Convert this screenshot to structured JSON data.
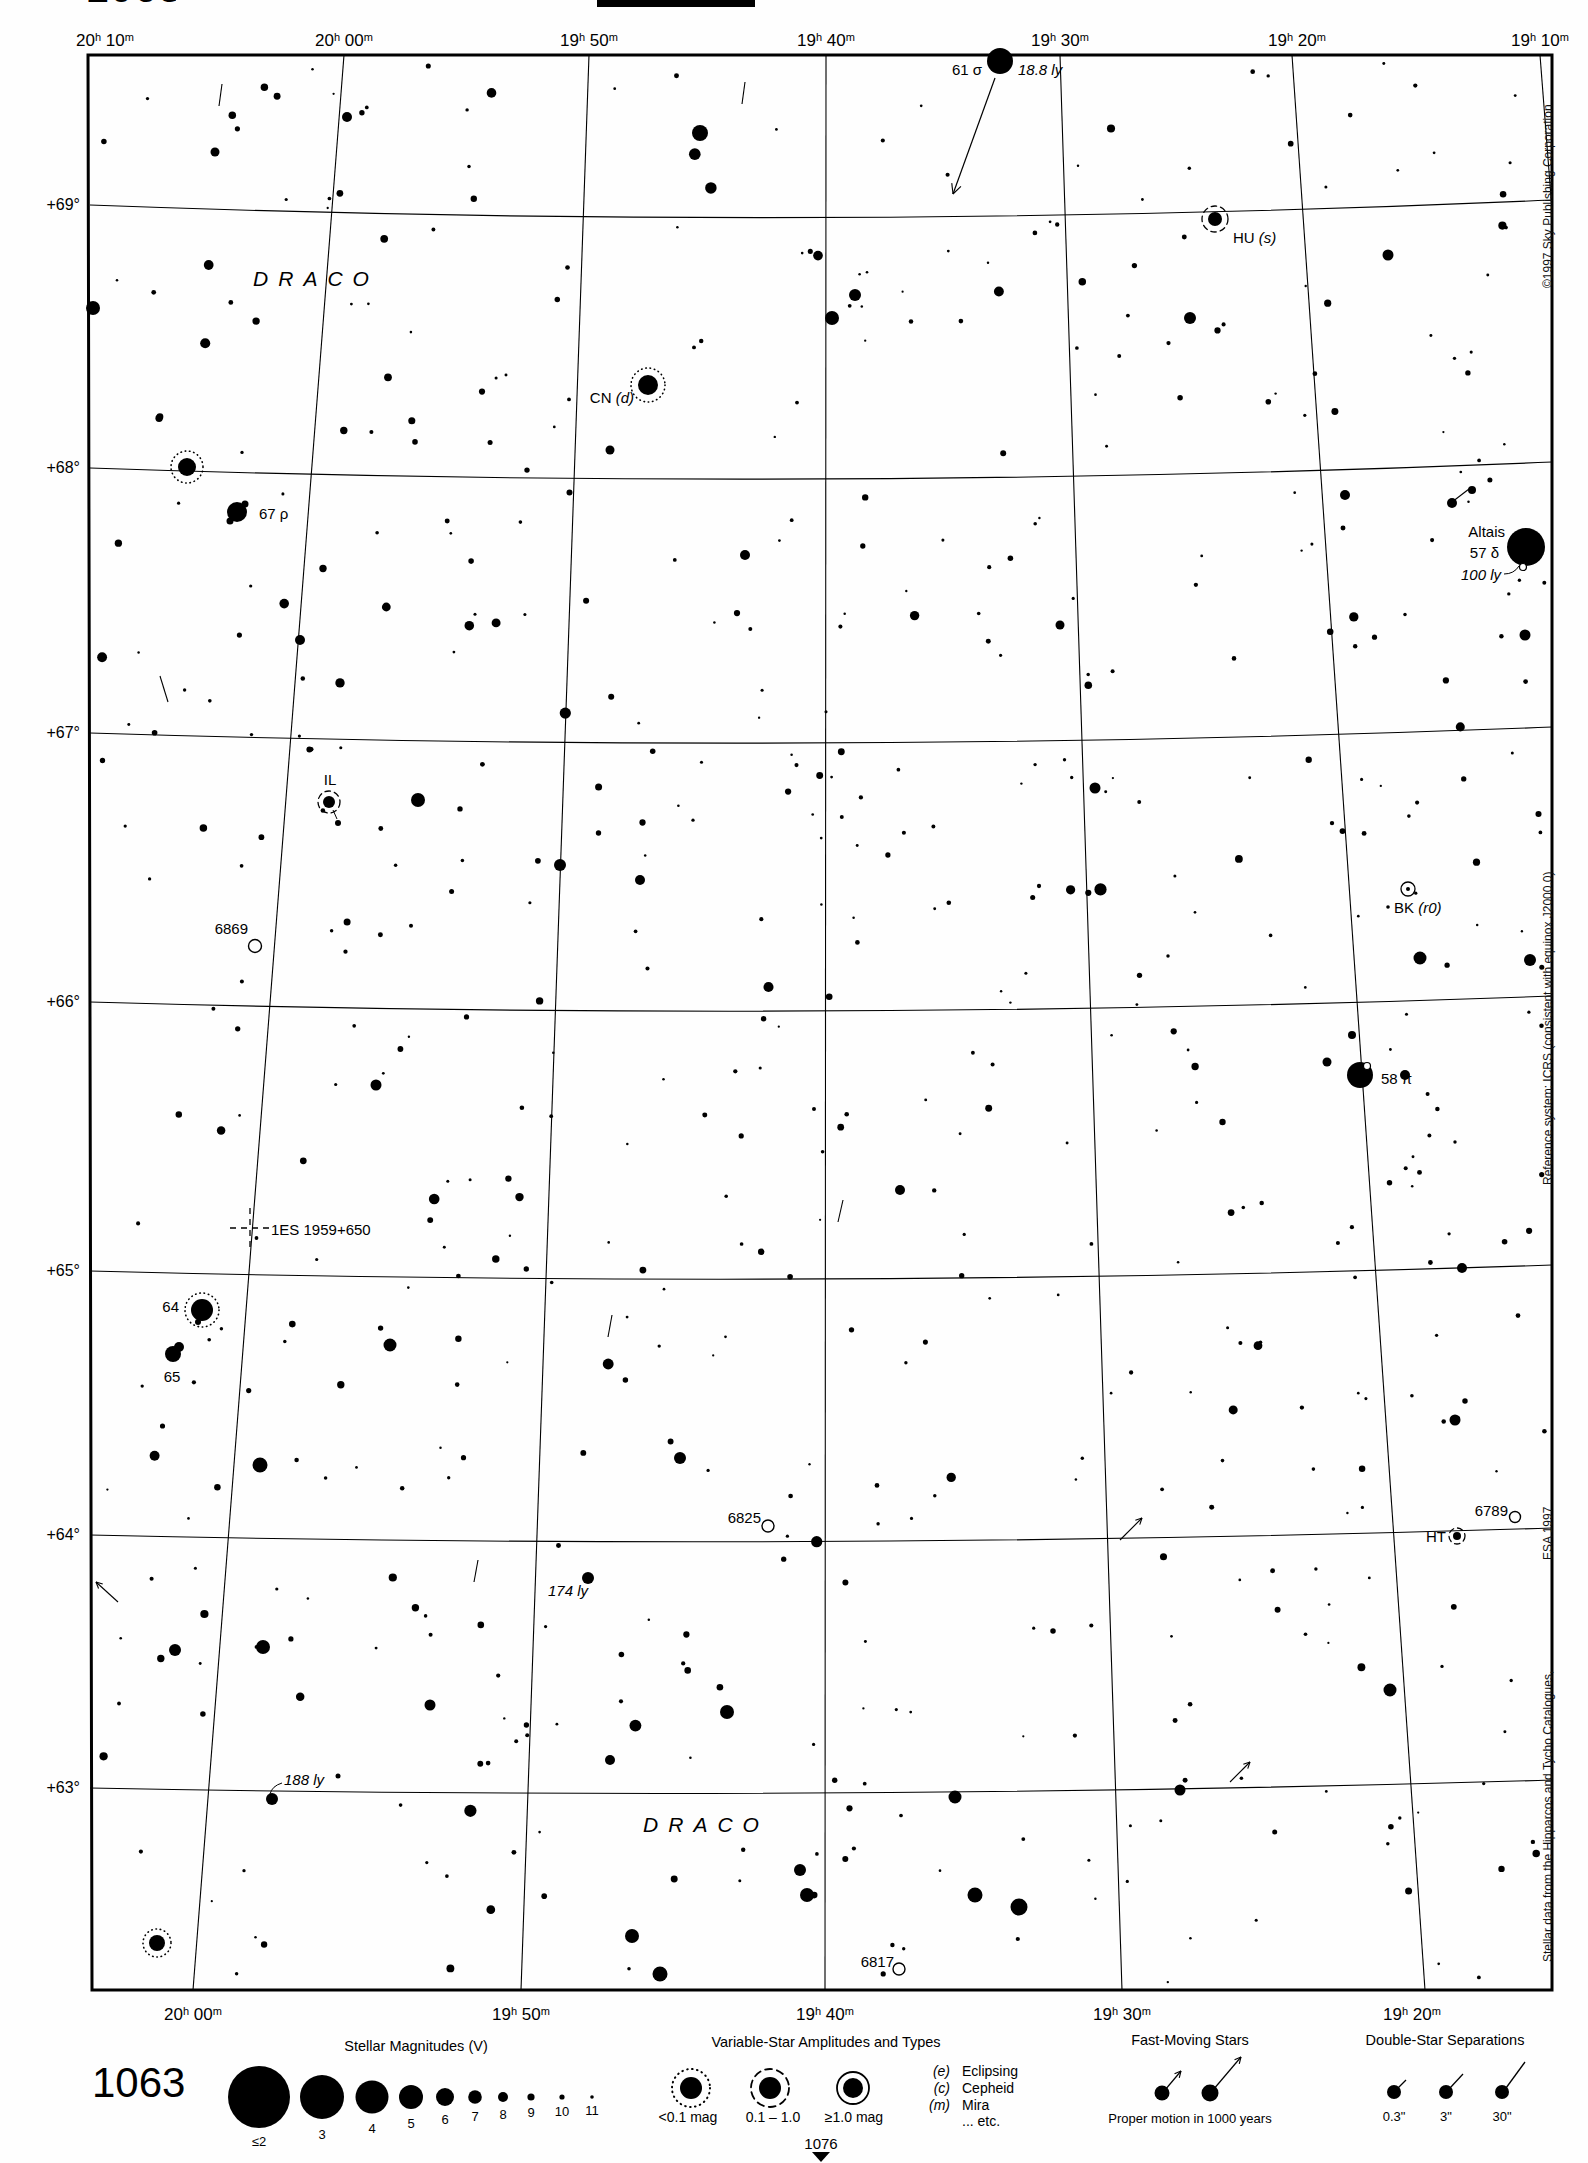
{
  "page": {
    "number": "1063",
    "cropped_top_left": "1063",
    "pointer_to_adjacent_chart": "1076"
  },
  "credits": {
    "copyright": "©1997 Sky Publishing Corporation",
    "reference": "Reference system: ICRS (consistent with equinox J2000.0)",
    "stellar_data": "Stellar data from the Hipparcos and Tycho Catalogues,",
    "esa": "ESA 1997"
  },
  "axes": {
    "top": [
      {
        "hh": "20",
        "mm": "10",
        "x": 105
      },
      {
        "hh": "20",
        "mm": "00",
        "x": 344
      },
      {
        "hh": "19",
        "mm": "50",
        "x": 589
      },
      {
        "hh": "19",
        "mm": "40",
        "x": 826
      },
      {
        "hh": "19",
        "mm": "30",
        "x": 1060
      },
      {
        "hh": "19",
        "mm": "20",
        "x": 1297
      },
      {
        "hh": "19",
        "mm": "10",
        "x": 1540
      }
    ],
    "top_y": 40,
    "bottom": [
      {
        "hh": "20",
        "mm": "00",
        "x": 193
      },
      {
        "hh": "19",
        "mm": "50",
        "x": 521
      },
      {
        "hh": "19",
        "mm": "40",
        "x": 825
      },
      {
        "hh": "19",
        "mm": "30",
        "x": 1122
      },
      {
        "hh": "19",
        "mm": "20",
        "x": 1412
      }
    ],
    "bottom_y": 2014,
    "left": [
      {
        "label": "+69°",
        "y": 205
      },
      {
        "label": "+68°",
        "y": 468
      },
      {
        "label": "+67°",
        "y": 733
      },
      {
        "label": "+66°",
        "y": 1002
      },
      {
        "label": "+65°",
        "y": 1271
      },
      {
        "label": "+64°",
        "y": 1535
      },
      {
        "label": "+63°",
        "y": 1788
      }
    ],
    "left_x": 80
  },
  "grid": {
    "frame": [
      [
        88,
        55
      ],
      [
        1552,
        55
      ],
      [
        1552,
        1990
      ],
      [
        92,
        1990
      ]
    ],
    "dec_lines": [
      {
        "yl": 205,
        "yr": 200,
        "sag": 30
      },
      {
        "yl": 468,
        "yr": 462,
        "sag": 28
      },
      {
        "yl": 733,
        "yr": 727,
        "sag": 26
      },
      {
        "yl": 1002,
        "yr": 996,
        "sag": 24
      },
      {
        "yl": 1271,
        "yr": 1265,
        "sag": 22
      },
      {
        "yl": 1535,
        "yr": 1528,
        "sag": 20
      },
      {
        "yl": 1788,
        "yr": 1780,
        "sag": 18
      }
    ],
    "ra_lines": [
      [
        344,
        55,
        193,
        1990
      ],
      [
        589,
        55,
        521,
        1990
      ],
      [
        826,
        55,
        825,
        1990
      ],
      [
        1060,
        55,
        1122,
        1990
      ],
      [
        1292,
        55,
        1425,
        1990
      ],
      [
        1540,
        55,
        1552,
        210
      ]
    ]
  },
  "objects": [
    {
      "id": "61-sigma-draconis",
      "symbol": "star",
      "x": 1000,
      "y": 61,
      "r": 13,
      "arrow": {
        "x1": 995,
        "y1": 78,
        "x2": 953,
        "y2": 194
      },
      "labels": [
        {
          "parts": [
            [
              "61 σ",
              0
            ]
          ],
          "x": 982,
          "y": 69,
          "align": "end"
        },
        {
          "parts": [
            [
              "18.8 ly",
              1
            ]
          ],
          "x": 1018,
          "y": 69,
          "align": "start"
        }
      ]
    },
    {
      "id": "hu-draconis",
      "symbol": "var-dashed",
      "x": 1215,
      "y": 219,
      "r": 7,
      "ring": 13,
      "labels": [
        {
          "parts": [
            [
              "HU ",
              0
            ],
            [
              "(s)",
              1
            ]
          ],
          "x": 1233,
          "y": 237,
          "align": "start"
        }
      ]
    },
    {
      "id": "draco-label-north",
      "symbol": "label-only",
      "labels": [
        {
          "parts": [
            [
              "DRACO",
              0
            ]
          ],
          "x": 316,
          "y": 278,
          "align": "center",
          "cls": "constellation"
        }
      ]
    },
    {
      "id": "cn-draconis",
      "symbol": "var-dotted",
      "x": 648,
      "y": 385,
      "r": 10,
      "ring": 17,
      "labels": [
        {
          "parts": [
            [
              "CN ",
              0
            ],
            [
              "(d)",
              1
            ]
          ],
          "x": 634,
          "y": 397,
          "align": "end"
        }
      ]
    },
    {
      "id": "67-rho-draconis",
      "symbol": "star",
      "x": 237,
      "y": 512,
      "r": 10,
      "companions": [
        [
          8,
          -8,
          3.5
        ],
        [
          -7,
          9,
          3.5
        ]
      ],
      "labels": [
        {
          "parts": [
            [
              "67 ρ",
              0
            ]
          ],
          "x": 259,
          "y": 513,
          "align": "start"
        }
      ]
    },
    {
      "id": "variable-near-68",
      "symbol": "var-dotted",
      "x": 187,
      "y": 467,
      "r": 9,
      "ring": 16,
      "labels": []
    },
    {
      "id": "altais-57-delta-draconis",
      "symbol": "star",
      "x": 1526,
      "y": 547,
      "r": 19,
      "open_companions": [
        [
          -3,
          20,
          3.5
        ]
      ],
      "labels": [
        {
          "parts": [
            [
              "Altais",
              0
            ]
          ],
          "x": 1505,
          "y": 531,
          "align": "end"
        },
        {
          "parts": [
            [
              "57 δ",
              0
            ]
          ],
          "x": 1499,
          "y": 552,
          "align": "end"
        },
        {
          "parts": [
            [
              "100 ly",
              1
            ]
          ],
          "x": 1501,
          "y": 574,
          "align": "end"
        }
      ],
      "leaders": [
        {
          "d": "M 1504 574 Q 1514 574 1519 566"
        }
      ]
    },
    {
      "id": "il-draconis",
      "symbol": "var-dashed",
      "x": 329,
      "y": 802,
      "r": 6,
      "ring": 11,
      "companions": [
        [
          9,
          21,
          3
        ]
      ],
      "labels": [
        {
          "parts": [
            [
              "IL",
              0
            ]
          ],
          "x": 330,
          "y": 779,
          "align": "center"
        }
      ],
      "leaders": [
        {
          "d": "M 333 810 L 337 819"
        }
      ]
    },
    {
      "id": "ngc-6869",
      "symbol": "open-cluster",
      "x": 255,
      "y": 946,
      "r": 6.5,
      "labels": [
        {
          "parts": [
            [
              "6869",
              0
            ]
          ],
          "x": 248,
          "y": 928,
          "align": "end"
        }
      ]
    },
    {
      "id": "bk-draconis",
      "symbol": "circled-dot",
      "x": 1408,
      "y": 889,
      "r": 7,
      "companions": [
        [
          -20,
          18,
          1.8
        ]
      ],
      "labels": [
        {
          "parts": [
            [
              "BK ",
              0
            ],
            [
              "(r0)",
              1
            ]
          ],
          "x": 1394,
          "y": 907,
          "align": "start"
        }
      ]
    },
    {
      "id": "58-pi-draconis",
      "symbol": "star",
      "x": 1360,
      "y": 1075,
      "r": 13,
      "open_companions": [
        [
          7,
          -9,
          3.5
        ]
      ],
      "labels": [
        {
          "parts": [
            [
              "58 π",
              0
            ]
          ],
          "x": 1381,
          "y": 1078,
          "align": "start"
        }
      ]
    },
    {
      "id": "1es-1959+650",
      "symbol": "dashed-cross",
      "x": 250,
      "y": 1228,
      "r": 20,
      "labels": [
        {
          "parts": [
            [
              "1ES 1959+650",
              0
            ]
          ],
          "x": 271,
          "y": 1229,
          "align": "start"
        }
      ]
    },
    {
      "id": "64-draconis",
      "symbol": "var-dotted",
      "x": 202,
      "y": 1310,
      "r": 11,
      "ring": 17,
      "companions": [
        [
          -4,
          12,
          3
        ]
      ],
      "labels": [
        {
          "parts": [
            [
              "64",
              0
            ]
          ],
          "x": 179,
          "y": 1306,
          "align": "end"
        }
      ]
    },
    {
      "id": "65-draconis",
      "symbol": "star",
      "x": 173,
      "y": 1354,
      "r": 8,
      "companions": [
        [
          6,
          -7,
          5
        ]
      ],
      "labels": [
        {
          "parts": [
            [
              "65",
              0
            ]
          ],
          "x": 172,
          "y": 1376,
          "align": "center"
        }
      ]
    },
    {
      "id": "ngc-6825",
      "symbol": "open-cluster",
      "x": 768,
      "y": 1526,
      "r": 6,
      "labels": [
        {
          "parts": [
            [
              "6825",
              0
            ]
          ],
          "x": 761,
          "y": 1517,
          "align": "end"
        }
      ]
    },
    {
      "id": "star-174-ly",
      "symbol": "star",
      "x": 588,
      "y": 1578,
      "r": 6,
      "labels": [
        {
          "parts": [
            [
              "174 ly",
              1
            ]
          ],
          "x": 548,
          "y": 1590,
          "align": "start"
        }
      ]
    },
    {
      "id": "ngc-6789",
      "symbol": "open-cluster",
      "x": 1515,
      "y": 1517,
      "r": 5.5,
      "labels": [
        {
          "parts": [
            [
              "6789",
              0
            ]
          ],
          "x": 1508,
          "y": 1510,
          "align": "end"
        }
      ]
    },
    {
      "id": "ht-draconis",
      "symbol": "var-dashed",
      "x": 1457,
      "y": 1536,
      "r": 4,
      "ring": 8,
      "labels": [
        {
          "parts": [
            [
              "HT",
              0
            ]
          ],
          "x": 1446,
          "y": 1536,
          "align": "end"
        }
      ]
    },
    {
      "id": "star-188-ly",
      "symbol": "star",
      "x": 272,
      "y": 1799,
      "r": 6,
      "companions": [
        [
          66,
          -23,
          2.5
        ]
      ],
      "labels": [
        {
          "parts": [
            [
              "188 ly",
              1
            ]
          ],
          "x": 284,
          "y": 1779,
          "align": "start"
        }
      ],
      "leaders": [
        {
          "d": "M 282 1783 Q 272 1786 270 1794"
        }
      ]
    },
    {
      "id": "draco-label-south",
      "symbol": "label-only",
      "labels": [
        {
          "parts": [
            [
              "DRACO",
              0
            ]
          ],
          "x": 706,
          "y": 1824,
          "align": "center",
          "cls": "constellation"
        }
      ]
    },
    {
      "id": "ngc-6817",
      "symbol": "open-cluster",
      "x": 899,
      "y": 1969,
      "r": 6,
      "labels": [
        {
          "parts": [
            [
              "6817",
              0
            ]
          ],
          "x": 894,
          "y": 1961,
          "align": "end"
        }
      ]
    },
    {
      "id": "variable-bottom-left",
      "symbol": "var-dotted",
      "x": 157,
      "y": 1943,
      "r": 8,
      "ring": 14,
      "labels": []
    }
  ],
  "bright_stars": [
    [
      93,
      308,
      7
    ],
    [
      347,
      117,
      5
    ],
    [
      700,
      133,
      8
    ],
    [
      215,
      152,
      4.5
    ],
    [
      855,
      295,
      6
    ],
    [
      832,
      318,
      7
    ],
    [
      1190,
      318,
      6
    ],
    [
      1388,
      255,
      5.5
    ],
    [
      610,
      450,
      4.5
    ],
    [
      745,
      555,
      5
    ],
    [
      300,
      640,
      5
    ],
    [
      1060,
      625,
      4.5
    ],
    [
      418,
      800,
      7
    ],
    [
      560,
      865,
      6
    ],
    [
      640,
      880,
      5
    ],
    [
      1095,
      788,
      5.5
    ],
    [
      1452,
      503,
      5
    ],
    [
      1525,
      635,
      5.5
    ],
    [
      1472,
      490,
      4
    ],
    [
      1420,
      958,
      6.5
    ],
    [
      1530,
      960,
      6
    ],
    [
      900,
      1190,
      5
    ],
    [
      1462,
      1268,
      5
    ],
    [
      390,
      1345,
      6.5
    ],
    [
      260,
      1465,
      7.5
    ],
    [
      680,
      1458,
      6
    ],
    [
      175,
      1650,
      6
    ],
    [
      263,
      1647,
      7
    ],
    [
      430,
      1705,
      5.5
    ],
    [
      727,
      1712,
      7
    ],
    [
      955,
      1797,
      6.5
    ],
    [
      975,
      1895,
      7.5
    ],
    [
      1019,
      1907,
      8.5
    ],
    [
      660,
      1974,
      7.5
    ],
    [
      632,
      1936,
      7
    ],
    [
      800,
      1870,
      6
    ],
    [
      1180,
      1790,
      5.5
    ],
    [
      1390,
      1690,
      6.5
    ],
    [
      1455,
      1420,
      5.5
    ],
    [
      1405,
      1075,
      5
    ],
    [
      807,
      1895,
      7
    ],
    [
      1345,
      495,
      5
    ],
    [
      1327,
      1062,
      4.5
    ],
    [
      1352,
      1035,
      4
    ],
    [
      610,
      1760,
      5
    ],
    [
      376,
      1085,
      5.5
    ]
  ],
  "proper_motion_marks": [
    {
      "x1": 222,
      "y1": 84,
      "x2": 219,
      "y2": 106
    },
    {
      "x1": 745,
      "y1": 82,
      "x2": 742,
      "y2": 104
    },
    {
      "x1": 1452,
      "y1": 502,
      "x2": 1469,
      "y2": 489
    },
    {
      "x1": 168,
      "y1": 702,
      "x2": 160,
      "y2": 676
    },
    {
      "x1": 118,
      "y1": 1602,
      "x2": 96,
      "y2": 1582,
      "head": "open"
    },
    {
      "x1": 1120,
      "y1": 1540,
      "x2": 1142,
      "y2": 1518,
      "head": "open"
    },
    {
      "x1": 1230,
      "y1": 1782,
      "x2": 1250,
      "y2": 1762,
      "head": "open"
    },
    {
      "x1": 843,
      "y1": 1200,
      "x2": 838,
      "y2": 1222
    },
    {
      "x1": 612,
      "y1": 1315,
      "x2": 608,
      "y2": 1337
    },
    {
      "x1": 478,
      "y1": 1560,
      "x2": 474,
      "y2": 1582
    }
  ],
  "field": {
    "seed": 19,
    "count": 600
  },
  "legend": {
    "magnitudes": {
      "title": "Stellar Magnitudes (V)",
      "title_x": 416,
      "title_y": 2046,
      "row_y": 2097,
      "items": [
        {
          "x": 259,
          "r": 31,
          "label": "≤2",
          "ly": 2141
        },
        {
          "x": 322,
          "r": 22,
          "label": "3",
          "ly": 2134
        },
        {
          "x": 372,
          "r": 16.5,
          "label": "4",
          "ly": 2128
        },
        {
          "x": 411,
          "r": 12,
          "label": "5",
          "ly": 2123
        },
        {
          "x": 445,
          "r": 9,
          "label": "6",
          "ly": 2119
        },
        {
          "x": 475,
          "r": 6.8,
          "label": "7",
          "ly": 2116
        },
        {
          "x": 503,
          "r": 5,
          "label": "8",
          "ly": 2114
        },
        {
          "x": 531,
          "r": 3.6,
          "label": "9",
          "ly": 2112
        },
        {
          "x": 562,
          "r": 2.6,
          "label": "10",
          "ly": 2111
        },
        {
          "x": 592,
          "r": 1.8,
          "label": "11",
          "ly": 2110
        }
      ]
    },
    "variables": {
      "title": "Variable-Star Amplitudes and Types",
      "title_x": 826,
      "title_y": 2042,
      "row_y": 2088,
      "symbols": [
        {
          "x": 691,
          "type": "dotted",
          "star": 11,
          "ring": 19,
          "label": "<0.1 mag",
          "lx": 688,
          "ly": 2117
        },
        {
          "x": 770,
          "type": "dashed",
          "star": 11,
          "ring": 19,
          "label": "0.1 – 1.0",
          "lx": 773,
          "ly": 2117
        },
        {
          "x": 853,
          "type": "solid",
          "star": 10,
          "ring": 16,
          "label": "≥1.0 mag",
          "lx": 854,
          "ly": 2117
        }
      ],
      "types": [
        {
          "code": "(e)",
          "name": "Eclipsing",
          "y": 2071
        },
        {
          "code": "(c)",
          "name": "Cepheid",
          "y": 2088
        },
        {
          "code": "(m)",
          "name": "Mira",
          "y": 2105
        },
        {
          "code": "",
          "name": "... etc.",
          "y": 2121
        }
      ],
      "code_x": 950,
      "name_x": 962
    },
    "fast": {
      "title": "Fast-Moving Stars",
      "title_x": 1190,
      "title_y": 2040,
      "caption": "Proper motion in 1000 years",
      "caption_x": 1190,
      "caption_y": 2118,
      "stars": [
        {
          "x": 1162,
          "y": 2093,
          "r": 7.5,
          "ax": 1181,
          "ay": 2071
        },
        {
          "x": 1210,
          "y": 2093,
          "r": 8.5,
          "ax": 1241,
          "ay": 2057
        }
      ]
    },
    "doubles": {
      "title": "Double-Star Separations",
      "title_x": 1445,
      "title_y": 2040,
      "stars": [
        {
          "x": 1394,
          "y": 2092,
          "r": 7,
          "tx": 1406,
          "ty": 2080,
          "label": "0.3\"",
          "ly": 2116
        },
        {
          "x": 1446,
          "y": 2092,
          "r": 7,
          "tx": 1463,
          "ty": 2074,
          "label": "3\"",
          "ly": 2116
        },
        {
          "x": 1502,
          "y": 2092,
          "r": 7,
          "tx": 1525,
          "ty": 2062,
          "label": "30\"",
          "ly": 2116
        }
      ]
    },
    "pointer": {
      "number": "1076",
      "x": 821,
      "y": 2143,
      "tri": [
        [
          812,
          2152
        ],
        [
          830,
          2152
        ],
        [
          821,
          2162
        ]
      ]
    }
  }
}
